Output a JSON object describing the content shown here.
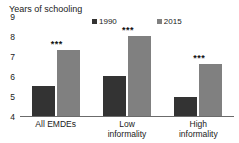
{
  "chart_data": {
    "type": "bar",
    "title": "Years of schooling",
    "xlabel": "",
    "ylabel": "",
    "ylim": [
      4,
      9
    ],
    "yticks": [
      4,
      5,
      6,
      7,
      8,
      9
    ],
    "grid": false,
    "legend_position": "top",
    "categories": [
      "All EMDEs",
      "Low\ninformality",
      "High\ninformality"
    ],
    "series": [
      {
        "name": "1990",
        "color": "#333333",
        "values": [
          5.5,
          6.0,
          4.95
        ]
      },
      {
        "name": "2015",
        "color": "#808080",
        "values": [
          7.3,
          8.0,
          6.6
        ]
      }
    ],
    "annotations": [
      {
        "category": "All EMDEs",
        "series": "2015",
        "text": "***"
      },
      {
        "category": "Low informality",
        "series": "2015",
        "text": "***"
      },
      {
        "category": "High informality",
        "series": "2015",
        "text": "***"
      }
    ]
  },
  "axis": {
    "title": "Years of schooling",
    "tick_labels": [
      "9",
      "8",
      "7",
      "6",
      "5",
      "4"
    ]
  },
  "legend": {
    "items": [
      {
        "label": "1990",
        "color": "#333333"
      },
      {
        "label": "2015",
        "color": "#808080"
      }
    ]
  },
  "categories": [
    {
      "label": "All EMDEs"
    },
    {
      "label": "Low\ninformality"
    },
    {
      "label": "High\ninformality"
    }
  ]
}
